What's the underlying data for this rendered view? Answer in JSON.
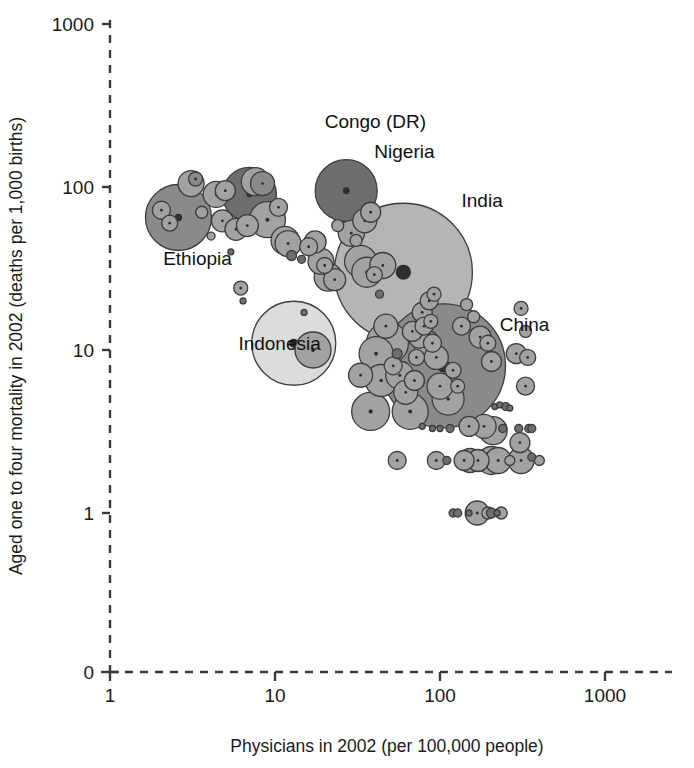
{
  "figure": {
    "background_color": "#ffffff",
    "ink_color": "#1a1a1a"
  },
  "chart_data": {
    "type": "scatter",
    "title": "",
    "subtitle": "",
    "xlabel": "Physicians in 2002 (per 100,000 people)",
    "ylabel": "Aged one to four mortality in 2002 (deaths per 1,000 births)",
    "x_scale": "log",
    "y_scale": "log",
    "xlim": [
      1,
      1000
    ],
    "ylim": [
      1,
      1000
    ],
    "x_ticks": [
      1,
      10,
      100,
      1000
    ],
    "x_tick_labels": [
      "1",
      "10",
      "100",
      "1000"
    ],
    "y_ticks": [
      1,
      10,
      100,
      1000
    ],
    "y_tick_labels": [
      "1",
      "10",
      "100",
      "1000"
    ],
    "y_origin_label": "0",
    "grid": false,
    "legend": "none",
    "marker": "bubble",
    "bubble_size_encodes": "population",
    "annotations": [
      {
        "text": "Congo (DR)",
        "x": 20,
        "y": 230
      },
      {
        "text": "Nigeria",
        "x": 40,
        "y": 150
      },
      {
        "text": "India",
        "x": 135,
        "y": 75
      },
      {
        "text": "China",
        "x": 230,
        "y": 13
      },
      {
        "text": "Ethiopia",
        "x": 2.1,
        "y": 33
      },
      {
        "text": "Indonesia",
        "x": 6.0,
        "y": 10
      }
    ],
    "labeled_points": [
      {
        "name": "Congo (DR)",
        "x": 7.0,
        "y": 90,
        "size": 54,
        "shade": "dark"
      },
      {
        "name": "Nigeria",
        "x": 27,
        "y": 95,
        "size": 128,
        "shade": "dark"
      },
      {
        "name": "India",
        "x": 60,
        "y": 30,
        "size": 1050,
        "shade": "light"
      },
      {
        "name": "China",
        "x": 105,
        "y": 8.0,
        "size": 1290,
        "shade": "mid-dark"
      },
      {
        "name": "Ethiopia",
        "x": 2.6,
        "y": 65,
        "size": 68,
        "shade": "mid-dark"
      },
      {
        "name": "Indonesia",
        "x": 13,
        "y": 11,
        "size": 215,
        "shade": "very-light"
      }
    ],
    "points": [
      {
        "x": 2.05,
        "y": 72,
        "r": 9,
        "shade": "mid"
      },
      {
        "x": 2.3,
        "y": 60,
        "r": 8,
        "shade": "mid"
      },
      {
        "x": 2.6,
        "y": 65,
        "r": 33,
        "shade": "mid-dark"
      },
      {
        "x": 3.1,
        "y": 105,
        "r": 13,
        "shade": "mid"
      },
      {
        "x": 3.3,
        "y": 112,
        "r": 7,
        "shade": "mid-dark"
      },
      {
        "x": 3.6,
        "y": 70,
        "r": 6,
        "shade": "mid"
      },
      {
        "x": 4.1,
        "y": 50,
        "r": 4,
        "shade": "mid"
      },
      {
        "x": 4.4,
        "y": 90,
        "r": 13,
        "shade": "mid"
      },
      {
        "x": 4.8,
        "y": 62,
        "r": 11,
        "shade": "mid"
      },
      {
        "x": 5.0,
        "y": 95,
        "r": 10,
        "shade": "mid"
      },
      {
        "x": 5.4,
        "y": 40,
        "r": 3,
        "shade": "dark"
      },
      {
        "x": 5.8,
        "y": 55,
        "r": 11,
        "shade": "mid"
      },
      {
        "x": 6.2,
        "y": 24,
        "r": 7,
        "shade": "mid"
      },
      {
        "x": 6.4,
        "y": 20,
        "r": 3,
        "shade": "dark"
      },
      {
        "x": 6.8,
        "y": 58,
        "r": 11,
        "shade": "mid"
      },
      {
        "x": 7.0,
        "y": 90,
        "r": 27,
        "shade": "dark"
      },
      {
        "x": 7.6,
        "y": 108,
        "r": 14,
        "shade": "mid"
      },
      {
        "x": 8.4,
        "y": 105,
        "r": 12,
        "shade": "mid-dark"
      },
      {
        "x": 9.0,
        "y": 63,
        "r": 18,
        "shade": "mid"
      },
      {
        "x": 10.5,
        "y": 75,
        "r": 9,
        "shade": "mid"
      },
      {
        "x": 11.5,
        "y": 47,
        "r": 14,
        "shade": "mid"
      },
      {
        "x": 12.0,
        "y": 45,
        "r": 13,
        "shade": "mid"
      },
      {
        "x": 12.6,
        "y": 38,
        "r": 5,
        "shade": "dark"
      },
      {
        "x": 13.0,
        "y": 11,
        "r": 42,
        "shade": "very-light"
      },
      {
        "x": 17.0,
        "y": 10,
        "r": 18,
        "shade": "mid"
      },
      {
        "x": 14.5,
        "y": 36,
        "r": 4,
        "shade": "dark"
      },
      {
        "x": 15.0,
        "y": 17,
        "r": 3,
        "shade": "dark"
      },
      {
        "x": 16.0,
        "y": 43,
        "r": 9,
        "shade": "mid"
      },
      {
        "x": 17.5,
        "y": 46,
        "r": 11,
        "shade": "mid"
      },
      {
        "x": 19.0,
        "y": 35,
        "r": 13,
        "shade": "mid"
      },
      {
        "x": 20.0,
        "y": 33,
        "r": 8,
        "shade": "mid"
      },
      {
        "x": 21.0,
        "y": 28,
        "r": 14,
        "shade": "mid"
      },
      {
        "x": 23.0,
        "y": 27,
        "r": 11,
        "shade": "mid"
      },
      {
        "x": 24.0,
        "y": 58,
        "r": 6,
        "shade": "mid"
      },
      {
        "x": 27.0,
        "y": 95,
        "r": 31,
        "shade": "dark"
      },
      {
        "x": 29.0,
        "y": 52,
        "r": 13,
        "shade": "mid"
      },
      {
        "x": 31.0,
        "y": 47,
        "r": 6,
        "shade": "mid"
      },
      {
        "x": 33.0,
        "y": 35,
        "r": 16,
        "shade": "mid"
      },
      {
        "x": 36.0,
        "y": 30,
        "r": 15,
        "shade": "mid"
      },
      {
        "x": 40.0,
        "y": 29,
        "r": 8,
        "shade": "mid"
      },
      {
        "x": 43.0,
        "y": 22,
        "r": 4,
        "shade": "dark"
      },
      {
        "x": 60.0,
        "y": 30,
        "r": 69,
        "shade": "light"
      },
      {
        "x": 55.0,
        "y": 9.5,
        "r": 5,
        "shade": "dark"
      },
      {
        "x": 48.0,
        "y": 11,
        "r": 21,
        "shade": "mid"
      },
      {
        "x": 52.0,
        "y": 8.0,
        "r": 9,
        "shade": "mid"
      },
      {
        "x": 57.0,
        "y": 7.0,
        "r": 14,
        "shade": "mid"
      },
      {
        "x": 62.0,
        "y": 5.5,
        "r": 12,
        "shade": "mid"
      },
      {
        "x": 66.0,
        "y": 4.2,
        "r": 18,
        "shade": "mid"
      },
      {
        "x": 70.0,
        "y": 6.5,
        "r": 10,
        "shade": "mid"
      },
      {
        "x": 75.0,
        "y": 12,
        "r": 11,
        "shade": "mid"
      },
      {
        "x": 80.0,
        "y": 14,
        "r": 9,
        "shade": "mid"
      },
      {
        "x": 88.0,
        "y": 15,
        "r": 7,
        "shade": "mid"
      },
      {
        "x": 95.0,
        "y": 9.0,
        "r": 12,
        "shade": "mid"
      },
      {
        "x": 105.0,
        "y": 8.0,
        "r": 62,
        "shade": "mid-dark"
      },
      {
        "x": 100.0,
        "y": 6.0,
        "r": 13,
        "shade": "mid"
      },
      {
        "x": 112.0,
        "y": 5.0,
        "r": 16,
        "shade": "mid"
      },
      {
        "x": 120.0,
        "y": 7.5,
        "r": 8,
        "shade": "mid"
      },
      {
        "x": 128.0,
        "y": 6.0,
        "r": 7,
        "shade": "mid"
      },
      {
        "x": 135.0,
        "y": 14,
        "r": 9,
        "shade": "mid"
      },
      {
        "x": 145.0,
        "y": 19,
        "r": 6,
        "shade": "mid"
      },
      {
        "x": 160.0,
        "y": 16,
        "r": 6,
        "shade": "mid"
      },
      {
        "x": 175.0,
        "y": 12,
        "r": 11,
        "shade": "mid"
      },
      {
        "x": 195.0,
        "y": 11,
        "r": 8,
        "shade": "mid"
      },
      {
        "x": 205.0,
        "y": 8.5,
        "r": 10,
        "shade": "mid"
      },
      {
        "x": 215.0,
        "y": 4.5,
        "r": 3,
        "shade": "dark"
      },
      {
        "x": 230.0,
        "y": 4.6,
        "r": 3,
        "shade": "dark"
      },
      {
        "x": 250.0,
        "y": 4.5,
        "r": 4,
        "shade": "dark"
      },
      {
        "x": 265.0,
        "y": 4.4,
        "r": 3,
        "shade": "dark"
      },
      {
        "x": 150.0,
        "y": 3.4,
        "r": 10,
        "shade": "mid"
      },
      {
        "x": 185.0,
        "y": 3.4,
        "r": 12,
        "shade": "mid"
      },
      {
        "x": 210.0,
        "y": 3.2,
        "r": 14,
        "shade": "mid"
      },
      {
        "x": 240.0,
        "y": 3.3,
        "r": 4,
        "shade": "dark"
      },
      {
        "x": 90.0,
        "y": 3.3,
        "r": 3,
        "shade": "dark"
      },
      {
        "x": 100.0,
        "y": 3.3,
        "r": 3,
        "shade": "dark"
      },
      {
        "x": 115.0,
        "y": 3.3,
        "r": 4,
        "shade": "dark"
      },
      {
        "x": 78.0,
        "y": 3.4,
        "r": 3,
        "shade": "dark"
      },
      {
        "x": 55.0,
        "y": 2.1,
        "r": 9,
        "shade": "mid"
      },
      {
        "x": 95.0,
        "y": 2.1,
        "r": 9,
        "shade": "mid"
      },
      {
        "x": 110.0,
        "y": 2.1,
        "r": 4,
        "shade": "dark"
      },
      {
        "x": 140.0,
        "y": 2.1,
        "r": 10,
        "shade": "mid"
      },
      {
        "x": 152.0,
        "y": 2.1,
        "r": 12,
        "shade": "mid"
      },
      {
        "x": 170.0,
        "y": 2.1,
        "r": 11,
        "shade": "mid"
      },
      {
        "x": 205.0,
        "y": 2.1,
        "r": 14,
        "shade": "mid"
      },
      {
        "x": 225.0,
        "y": 2.1,
        "r": 13,
        "shade": "mid"
      },
      {
        "x": 265.0,
        "y": 2.1,
        "r": 5,
        "shade": "mid"
      },
      {
        "x": 120.0,
        "y": 1.0,
        "r": 4,
        "shade": "dark"
      },
      {
        "x": 128.0,
        "y": 1.0,
        "r": 4,
        "shade": "dark"
      },
      {
        "x": 150.0,
        "y": 1.0,
        "r": 3,
        "shade": "dark"
      },
      {
        "x": 168.0,
        "y": 1.0,
        "r": 12,
        "shade": "mid"
      },
      {
        "x": 195.0,
        "y": 1.0,
        "r": 6,
        "shade": "mid"
      },
      {
        "x": 205.0,
        "y": 1.0,
        "r": 5,
        "shade": "dark"
      },
      {
        "x": 222.0,
        "y": 1.0,
        "r": 3,
        "shade": "dark"
      },
      {
        "x": 235.0,
        "y": 1.0,
        "r": 6,
        "shade": "mid"
      },
      {
        "x": 310.0,
        "y": 18,
        "r": 7,
        "shade": "mid"
      },
      {
        "x": 330.0,
        "y": 13,
        "r": 6,
        "shade": "mid"
      },
      {
        "x": 290.0,
        "y": 9.5,
        "r": 10,
        "shade": "mid"
      },
      {
        "x": 340.0,
        "y": 9.0,
        "r": 8,
        "shade": "mid"
      },
      {
        "x": 330.0,
        "y": 6.0,
        "r": 9,
        "shade": "mid"
      },
      {
        "x": 300.0,
        "y": 3.3,
        "r": 4,
        "shade": "dark"
      },
      {
        "x": 345.0,
        "y": 3.3,
        "r": 4,
        "shade": "dark"
      },
      {
        "x": 360.0,
        "y": 3.3,
        "r": 4,
        "shade": "dark"
      },
      {
        "x": 305.0,
        "y": 2.7,
        "r": 10,
        "shade": "mid"
      },
      {
        "x": 310.0,
        "y": 2.1,
        "r": 13,
        "shade": "mid"
      },
      {
        "x": 360.0,
        "y": 2.2,
        "r": 4,
        "shade": "dark"
      },
      {
        "x": 400.0,
        "y": 2.1,
        "r": 5,
        "shade": "mid"
      },
      {
        "x": 38.0,
        "y": 70,
        "r": 10,
        "shade": "mid"
      },
      {
        "x": 35.0,
        "y": 62,
        "r": 12,
        "shade": "mid"
      },
      {
        "x": 45.0,
        "y": 33,
        "r": 13,
        "shade": "mid"
      },
      {
        "x": 47.0,
        "y": 14,
        "r": 12,
        "shade": "mid"
      },
      {
        "x": 41.0,
        "y": 9.5,
        "r": 17,
        "shade": "mid"
      },
      {
        "x": 44.0,
        "y": 6.5,
        "r": 16,
        "shade": "mid"
      },
      {
        "x": 38.0,
        "y": 4.2,
        "r": 19,
        "shade": "mid"
      },
      {
        "x": 33.0,
        "y": 7.0,
        "r": 12,
        "shade": "mid"
      },
      {
        "x": 86.0,
        "y": 20,
        "r": 9,
        "shade": "mid"
      },
      {
        "x": 92.0,
        "y": 22,
        "r": 7,
        "shade": "mid"
      },
      {
        "x": 78.0,
        "y": 17,
        "r": 10,
        "shade": "mid"
      },
      {
        "x": 83.0,
        "y": 11,
        "r": 13,
        "shade": "mid"
      },
      {
        "x": 90.0,
        "y": 11,
        "r": 9,
        "shade": "mid"
      },
      {
        "x": 72.0,
        "y": 9.0,
        "r": 8,
        "shade": "mid"
      },
      {
        "x": 68.0,
        "y": 13,
        "r": 10,
        "shade": "mid"
      }
    ],
    "shade_colors": {
      "very-light": "#dcdcdc",
      "light": "#b5b5b5",
      "mid": "#a2a2a2",
      "mid-dark": "#8a8a8a",
      "dark": "#6e6e6e"
    }
  },
  "axes_geometry": {
    "left_px": 110,
    "bottom_px": 672,
    "top_px": 20,
    "right_px": 672,
    "x_decade_px": 165,
    "y_decade_px": 163,
    "y_zero_px": 672,
    "y_one_px": 513
  }
}
